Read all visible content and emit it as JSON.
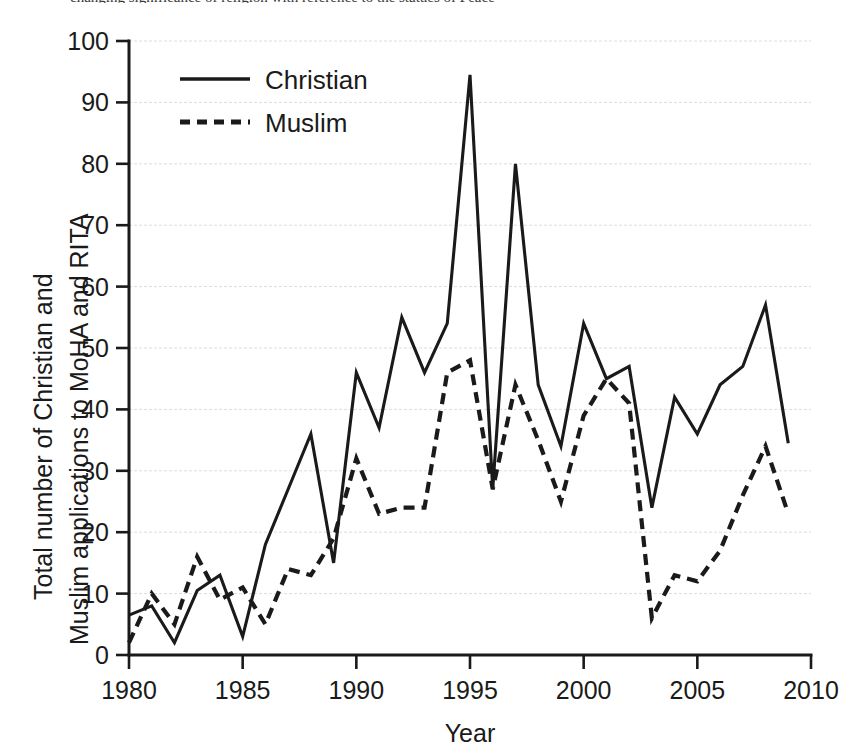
{
  "figure": {
    "truncated_caption": "changing significance of religion with reference to the statues of Peace"
  },
  "chart_data": {
    "type": "line",
    "title": "",
    "xlabel": "Year",
    "ylabel": "Total number of Christian and Muslim applications to MoHA and RITA",
    "ylabel_line1": "Total number of Christian and",
    "ylabel_line2": "Muslim applications to MoHA and RITA",
    "xlim": [
      1980,
      2010
    ],
    "ylim": [
      0,
      100
    ],
    "xticks": [
      1980,
      1985,
      1990,
      1995,
      2000,
      2005,
      2010
    ],
    "yticks": [
      0,
      10,
      20,
      30,
      40,
      50,
      60,
      70,
      80,
      90,
      100
    ],
    "grid": "horizontal",
    "legend_position": "top-left-inside",
    "x": [
      1980,
      1981,
      1982,
      1983,
      1984,
      1985,
      1986,
      1987,
      1988,
      1989,
      1990,
      1991,
      1992,
      1993,
      1994,
      1995,
      1996,
      1997,
      1998,
      1999,
      2000,
      2001,
      2002,
      2003,
      2004,
      2005,
      2006,
      2007,
      2008,
      2009
    ],
    "series": [
      {
        "name": "Christian",
        "style": "solid",
        "color": "#1a1a1a",
        "values": [
          6.5,
          8,
          2,
          10.5,
          13,
          3,
          18,
          27,
          36,
          15,
          46,
          37,
          55,
          46,
          54,
          94.5,
          27,
          80,
          44,
          34,
          54,
          45,
          47,
          24,
          42,
          36,
          44,
          47,
          57,
          34.5
        ]
      },
      {
        "name": "Muslim",
        "style": "dashed",
        "color": "#1a1a1a",
        "values": [
          2,
          10,
          5,
          16,
          9,
          11,
          5,
          14,
          13,
          19,
          32,
          23,
          24,
          24,
          46,
          48,
          27,
          44,
          35,
          25,
          39,
          45,
          41,
          6,
          13,
          12,
          17,
          26,
          34,
          23
        ]
      }
    ],
    "annotations": {
      "peak_christian_year": 1995,
      "peak_christian_value": 94.5,
      "second_peak_christian_year": 1997,
      "second_peak_christian_value": 80,
      "peak_muslim_year": 1995,
      "peak_muslim_value": 48,
      "min_christian_value": 2,
      "min_muslim_value": 2
    }
  }
}
